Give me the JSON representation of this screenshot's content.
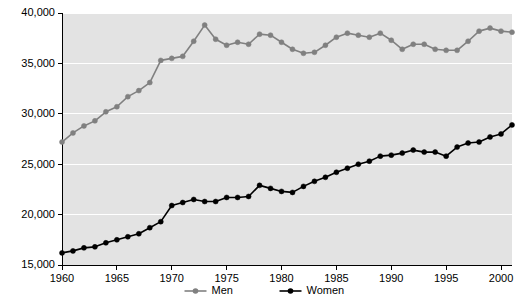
{
  "chart_data": {
    "type": "line",
    "title": "",
    "xlabel": "",
    "ylabel": "",
    "xlim": [
      1960,
      2001
    ],
    "ylim": [
      15000,
      40000
    ],
    "ytick_values": [
      15000,
      20000,
      25000,
      30000,
      35000,
      40000
    ],
    "ytick_labels": [
      "15,000",
      "20,000",
      "25,000",
      "30,000",
      "35,000",
      "40,000"
    ],
    "xtick_values": [
      1960,
      1965,
      1970,
      1975,
      1980,
      1985,
      1990,
      1995,
      2000
    ],
    "xtick_labels": [
      "1960",
      "1965",
      "1970",
      "1975",
      "1980",
      "1985",
      "1990",
      "1995",
      "2000"
    ],
    "grid": "horizontal",
    "legend_position": "bottom-center",
    "plot_background": "#e3e3e3",
    "x": [
      1960,
      1961,
      1962,
      1963,
      1964,
      1965,
      1966,
      1967,
      1968,
      1969,
      1970,
      1971,
      1972,
      1973,
      1974,
      1975,
      1976,
      1977,
      1978,
      1979,
      1980,
      1981,
      1982,
      1983,
      1984,
      1985,
      1986,
      1987,
      1988,
      1989,
      1990,
      1991,
      1992,
      1993,
      1994,
      1995,
      1996,
      1997,
      1998,
      1999,
      2000,
      2001
    ],
    "series": [
      {
        "name": "Men",
        "color": "#808080",
        "marker": "circle",
        "values": [
          27200,
          28100,
          28800,
          29300,
          30200,
          30700,
          31700,
          32300,
          33100,
          35300,
          35500,
          35700,
          37200,
          38800,
          37400,
          36800,
          37100,
          36900,
          37900,
          37800,
          37100,
          36400,
          36000,
          36100,
          36800,
          37600,
          38000,
          37800,
          37600,
          38000,
          37300,
          36400,
          36900,
          36900,
          36400,
          36300,
          36300,
          37200,
          38200,
          38500,
          38200,
          38100
        ]
      },
      {
        "name": "Women",
        "color": "#000000",
        "marker": "circle",
        "values": [
          16200,
          16400,
          16700,
          16800,
          17200,
          17500,
          17800,
          18100,
          18700,
          19300,
          20900,
          21200,
          21500,
          21300,
          21300,
          21700,
          21700,
          21800,
          22900,
          22600,
          22300,
          22200,
          22800,
          23300,
          23700,
          24200,
          24600,
          25000,
          25300,
          25800,
          25900,
          26100,
          26400,
          26200,
          26200,
          25800,
          26700,
          27100,
          27200,
          27700,
          28000,
          28900
        ]
      }
    ]
  }
}
